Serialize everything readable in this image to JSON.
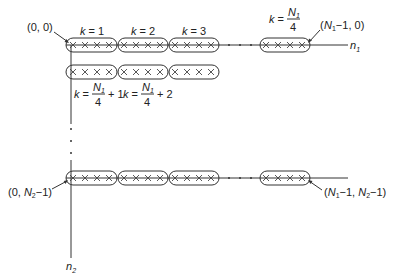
{
  "figure": {
    "axes": {
      "horizontal_label": "n",
      "horizontal_sub": "1",
      "vertical_label": "n",
      "vertical_sub": "2"
    },
    "corners": {
      "top_left": "(0, 0)",
      "top_right_prefix": "(N",
      "top_right_sub": "1",
      "top_right_suffix": "−1, 0)",
      "bottom_left_prefix": "(0, N",
      "bottom_left_sub": "2",
      "bottom_left_suffix": "−1)",
      "bottom_right_a": "(N",
      "bottom_right_sub1": "1",
      "bottom_right_b": "−1, N",
      "bottom_right_sub2": "2",
      "bottom_right_c": "−1)"
    },
    "block_labels": {
      "k1": "k = 1",
      "k2": "k = 2",
      "k3": "k = 3",
      "k_last_left": "k =",
      "k_last_num": "N",
      "k_last_num_sub": "1",
      "k_last_den": "4",
      "row2_k1_left": "k =",
      "row2_k1_num": "N",
      "row2_k1_num_sub": "1",
      "row2_k1_den": "4",
      "row2_k1_right": "+ 1",
      "row2_k2_left": "k =",
      "row2_k2_num": "N",
      "row2_k2_num_sub": "1",
      "row2_k2_den": "4",
      "row2_k2_right": "+ 2"
    },
    "elements_per_block": 4,
    "element_symbol": "×",
    "rows_shown": [
      "n2 = 0",
      "n2 = 1",
      "n2 = N2-1"
    ],
    "ellipsis": "· · ·"
  }
}
